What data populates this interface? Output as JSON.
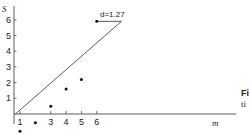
{
  "chart_data": {
    "type": "scatter",
    "title": "",
    "xlabel": "m",
    "ylabel": "S",
    "xlim": [
      0,
      11
    ],
    "ylim": [
      -1.3,
      6.4
    ],
    "grid": false,
    "x_ticks": [
      1,
      3,
      4,
      5,
      6
    ],
    "y_ticks": [
      1,
      2,
      3,
      4,
      5,
      6
    ],
    "series": [
      {
        "name": "points",
        "x": [
          1,
          2,
          3,
          4,
          5,
          6
        ],
        "y": [
          -1.1,
          -0.55,
          0.5,
          1.6,
          2.2,
          5.9
        ]
      }
    ],
    "reference_line": {
      "from": [
        0.7,
        0
      ],
      "to": [
        7.6,
        5.9
      ]
    },
    "annotation": {
      "text": "d=1.27",
      "segment_from": [
        6,
        5.9
      ],
      "segment_to": [
        7.6,
        5.9
      ]
    }
  },
  "caption": {
    "line1": "Fi",
    "line2": "ti"
  }
}
